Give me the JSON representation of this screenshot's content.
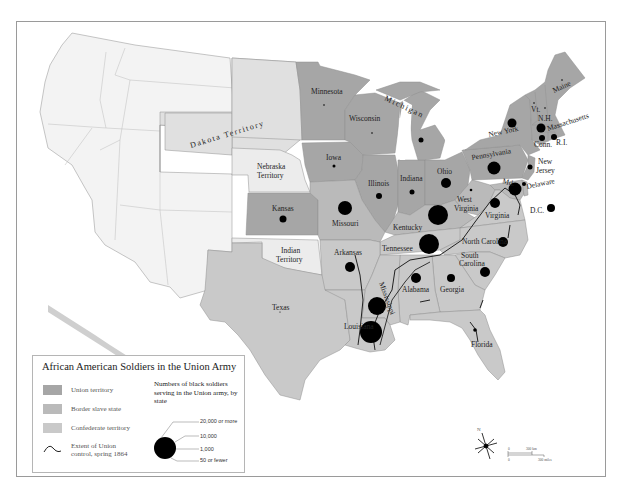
{
  "map": {
    "colors": {
      "union": "#a6a6a6",
      "border": "#bfbfbf",
      "confederate": "#c9c9c9",
      "territory_light": "#e2e2e2",
      "west_blank": "#f3f3f3",
      "water": "#ffffff",
      "stroke": "#8e8e8e",
      "dot": "#000000"
    },
    "labels": {
      "dakota": "Dakota Territory",
      "nebraska_1": "Nebraska",
      "nebraska_2": "Territory",
      "kansas": "Kansas",
      "indian_1": "Indian",
      "indian_2": "Territory",
      "texas": "Texas",
      "minnesota": "Minnesota",
      "wisconsin": "Wisconsin",
      "michigan": "Michigan",
      "iowa": "Iowa",
      "illinois": "Illinois",
      "indiana": "Indiana",
      "ohio": "Ohio",
      "missouri": "Missouri",
      "kentucky": "Kentucky",
      "west_virginia_1": "West",
      "west_virginia_2": "Virginia",
      "pennsylvania": "Pennsylvania",
      "new_york": "New York",
      "maine": "Maine",
      "vermont": "Vt.",
      "new_hampshire": "N.H.",
      "massachusetts": "Massachusetts",
      "connecticut": "Conn.",
      "rhode_island": "R.I.",
      "new_jersey_1": "New",
      "new_jersey_2": "Jersey",
      "delaware": "Delaware",
      "maryland": "Md.",
      "dc": "D.C.",
      "virginia": "Virginia",
      "north_carolina": "North Carolina",
      "south_carolina_1": "South",
      "south_carolina_2": "Carolina",
      "tennessee": "Tennessee",
      "arkansas": "Arkansas",
      "mississippi": "Mississippi",
      "alabama": "Alabama",
      "georgia": "Georgia",
      "louisiana": "Louisiana",
      "florida": "Florida"
    },
    "soldier_dots": [
      {
        "state": "Kansas",
        "cx": 283,
        "cy": 219,
        "r": 3.5
      },
      {
        "state": "Missouri",
        "cx": 345,
        "cy": 208,
        "r": 7
      },
      {
        "state": "Iowa",
        "cx": 334,
        "cy": 166,
        "r": 1.5
      },
      {
        "state": "Illinois",
        "cx": 379,
        "cy": 196,
        "r": 3
      },
      {
        "state": "Indiana",
        "cx": 412,
        "cy": 192,
        "r": 2.5
      },
      {
        "state": "Ohio",
        "cx": 446,
        "cy": 183,
        "r": 5
      },
      {
        "state": "Michigan",
        "cx": 421,
        "cy": 140,
        "r": 2.5
      },
      {
        "state": "Wisconsin",
        "cx": 372,
        "cy": 133,
        "r": 0.8
      },
      {
        "state": "Minnesota",
        "cx": 324,
        "cy": 105,
        "r": 0.8
      },
      {
        "state": "Kentucky",
        "cx": 438,
        "cy": 215,
        "r": 10
      },
      {
        "state": "West Virginia",
        "cx": 471,
        "cy": 190,
        "r": 1.3
      },
      {
        "state": "Pennsylvania",
        "cx": 494,
        "cy": 168,
        "r": 6.5
      },
      {
        "state": "New York",
        "cx": 512,
        "cy": 123,
        "r": 4.5
      },
      {
        "state": "Maine",
        "cx": 562,
        "cy": 80,
        "r": 0.8
      },
      {
        "state": "Vermont",
        "cx": 534,
        "cy": 103,
        "r": 0.8
      },
      {
        "state": "New Hampshire",
        "cx": 545,
        "cy": 108,
        "r": 0.8
      },
      {
        "state": "Massachusetts",
        "cx": 541,
        "cy": 128,
        "r": 4.5
      },
      {
        "state": "Connecticut",
        "cx": 542,
        "cy": 138,
        "r": 3
      },
      {
        "state": "Rhode Island",
        "cx": 554,
        "cy": 137,
        "r": 3
      },
      {
        "state": "New Jersey",
        "cx": 530,
        "cy": 167,
        "r": 2.5
      },
      {
        "state": "Delaware",
        "cx": 524,
        "cy": 184,
        "r": 2
      },
      {
        "state": "Maryland",
        "cx": 515,
        "cy": 189,
        "r": 6.5
      },
      {
        "state": "D.C.",
        "cx": 551,
        "cy": 208,
        "r": 4
      },
      {
        "state": "Virginia",
        "cx": 495,
        "cy": 203,
        "r": 5
      },
      {
        "state": "Tennessee",
        "cx": 429,
        "cy": 244,
        "r": 10
      },
      {
        "state": "North Carolina",
        "cx": 503,
        "cy": 242,
        "r": 5
      },
      {
        "state": "South Carolina",
        "cx": 485,
        "cy": 272,
        "r": 5
      },
      {
        "state": "Arkansas",
        "cx": 350,
        "cy": 267,
        "r": 5
      },
      {
        "state": "Alabama",
        "cx": 416,
        "cy": 278,
        "r": 5
      },
      {
        "state": "Georgia",
        "cx": 451,
        "cy": 278,
        "r": 4
      },
      {
        "state": "Mississippi",
        "cx": 377,
        "cy": 306,
        "r": 9
      },
      {
        "state": "Louisiana",
        "cx": 371,
        "cy": 332,
        "r": 11
      },
      {
        "state": "Florida",
        "cx": 475,
        "cy": 330,
        "r": 1.8
      },
      {
        "state": "Texas",
        "cx": 280,
        "cy": 312,
        "r": 0.6
      }
    ]
  },
  "legend": {
    "title": "African American Soldiers in the Union Army",
    "items": [
      {
        "label": "Union territory",
        "color": "#a6a6a6"
      },
      {
        "label": "Border slave state",
        "color": "#bababa"
      },
      {
        "label": "Confederate territory",
        "color": "#c9c9c9"
      }
    ],
    "line_label_1": "Extent of Union",
    "line_label_2": "control, spring 1864",
    "size_title": "Numbers of black soldiers serving in the Union army, by state",
    "sizes": [
      "20,000 or more",
      "10,000",
      "1,000",
      "50 or fewer"
    ]
  },
  "compass": {
    "north": "N"
  },
  "scale": {
    "km_zero": "0",
    "km_label": "300 km",
    "mi_zero": "0",
    "mi_label": "300 miles"
  }
}
